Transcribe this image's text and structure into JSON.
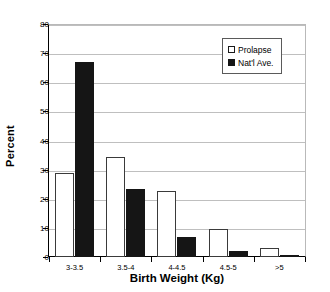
{
  "chart_data": {
    "type": "bar",
    "title": "",
    "xlabel": "Birth Weight (Kg)",
    "ylabel": "Percent",
    "categories": [
      "3-3.5",
      "3.5-4",
      "4-4.5",
      "4.5-5",
      ">5"
    ],
    "series": [
      {
        "name": "Prolapse",
        "color": "#ffffff",
        "values": [
          29,
          34.5,
          22.7,
          9.5,
          3
        ]
      },
      {
        "name": "Nat'l Ave.",
        "color": "#151515",
        "values": [
          67,
          23.5,
          7,
          2,
          0.2
        ]
      }
    ],
    "ylim": [
      0,
      80
    ],
    "yticks": [
      0,
      10,
      20,
      30,
      40,
      50,
      60,
      70,
      80
    ],
    "ytick_labels": [
      "0",
      "10",
      "20",
      "30",
      "40",
      "50",
      "60",
      "70",
      "80"
    ],
    "grid": true,
    "grid_axis": "y",
    "legend_position": "top-right",
    "legend_entries": [
      "Prolapse",
      "Nat'l Ave."
    ]
  }
}
